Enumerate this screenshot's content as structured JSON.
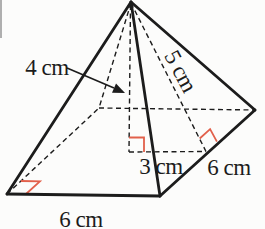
{
  "figure": {
    "type": "square-pyramid-measurement-diagram",
    "labels": {
      "height": "4 cm",
      "slant_height": "5 cm",
      "apothem": "3 cm",
      "base_edge_right": "6 cm",
      "base_edge_front": "6 cm"
    },
    "colors": {
      "line": "#1c1c1c",
      "right_angle_marker": "#e2604b",
      "background": "#fcfcfb"
    }
  }
}
